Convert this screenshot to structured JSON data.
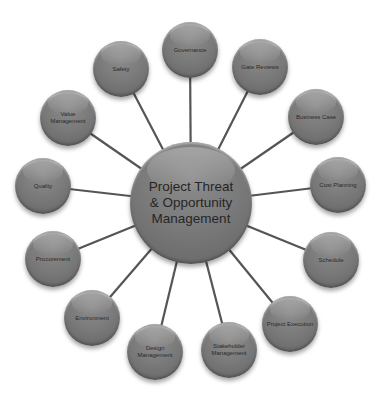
{
  "diagram": {
    "title": "Project Threat & Opportunity Management",
    "center": {
      "label": "Project Threat & Opportunity Management",
      "lines": [
        "Project Threat",
        "& Opportunity",
        "Management"
      ],
      "x": 191,
      "y": 203,
      "r": 61
    },
    "nodes": [
      {
        "id": "governance",
        "label": "Governance",
        "x": 190,
        "y": 50,
        "r": 28
      },
      {
        "id": "gate-reviews",
        "label": "Gate Reviews",
        "x": 260,
        "y": 67,
        "r": 28
      },
      {
        "id": "business-case",
        "label": "Business Case",
        "x": 316,
        "y": 117,
        "r": 28
      },
      {
        "id": "cost-planning",
        "label": "Cost Planning",
        "x": 338,
        "y": 185,
        "r": 28
      },
      {
        "id": "schedule",
        "label": "Schedule",
        "x": 331,
        "y": 260,
        "r": 28
      },
      {
        "id": "project-execution",
        "label": "Project Execution",
        "x": 290,
        "y": 324,
        "r": 28
      },
      {
        "id": "stakeholder-management",
        "label": "Stakeholder Management",
        "x": 229,
        "y": 350,
        "r": 28
      },
      {
        "id": "design-management",
        "label": "Design Management",
        "x": 155,
        "y": 352,
        "r": 28
      },
      {
        "id": "environment",
        "label": "Environment",
        "x": 92,
        "y": 318,
        "r": 28
      },
      {
        "id": "procurement",
        "label": "Procurement",
        "x": 53,
        "y": 259,
        "r": 28
      },
      {
        "id": "quality",
        "label": "Quality",
        "x": 43,
        "y": 186,
        "r": 28
      },
      {
        "id": "value-management",
        "label": "Value Management",
        "x": 68,
        "y": 118,
        "r": 28
      },
      {
        "id": "safety",
        "label": "Safety",
        "x": 121,
        "y": 69,
        "r": 28
      }
    ],
    "colors": {
      "node_fill": "#7b7b7b",
      "connector": "#555555",
      "text": "#2a2a2a",
      "background": "#ffffff"
    }
  }
}
